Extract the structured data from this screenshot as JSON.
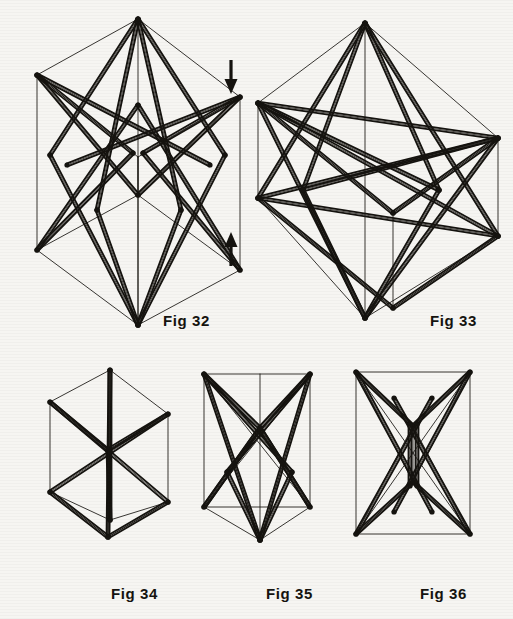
{
  "page": {
    "background_color": "#f6f5f2",
    "ink_color": "#15130f",
    "width": 513,
    "height": 619
  },
  "labels": [
    {
      "id": "fig32",
      "text": "Fig 32",
      "x": 163,
      "y": 312
    },
    {
      "id": "fig33",
      "text": "Fig 33",
      "x": 430,
      "y": 312
    },
    {
      "id": "fig34",
      "text": "Fig 34",
      "x": 111,
      "y": 585
    },
    {
      "id": "fig35",
      "text": "Fig 35",
      "x": 266,
      "y": 585
    },
    {
      "id": "fig36",
      "text": "Fig 36",
      "x": 420,
      "y": 585
    }
  ],
  "arrows": [
    {
      "id": "arrow-down",
      "direction": "down",
      "x": 230,
      "y_top": 60,
      "y_bottom": 92
    },
    {
      "id": "arrow-up",
      "direction": "up",
      "x": 230,
      "y_top": 232,
      "y_bottom": 264
    }
  ],
  "figures": [
    {
      "id": "fig32",
      "name": "tall-octahedral-tensegrity",
      "caption": "Fig 32",
      "viewbox": "0 0 250 335",
      "x": 5,
      "y": 5,
      "w": 250,
      "h": 335,
      "thin_lines": [
        [
          32,
          70,
          133,
          14
        ],
        [
          133,
          14,
          235,
          92
        ],
        [
          235,
          92,
          133,
          152
        ],
        [
          133,
          152,
          32,
          70
        ],
        [
          32,
          70,
          32,
          245
        ],
        [
          133,
          14,
          133,
          320
        ],
        [
          235,
          92,
          235,
          265
        ],
        [
          133,
          152,
          133,
          320
        ],
        [
          32,
          245,
          133,
          320
        ],
        [
          133,
          320,
          235,
          265
        ],
        [
          235,
          265,
          133,
          190
        ],
        [
          133,
          190,
          32,
          245
        ],
        [
          133,
          152,
          133,
          190
        ]
      ],
      "thick_struts": [
        [
          133,
          14,
          45,
          150
        ],
        [
          133,
          14,
          220,
          150
        ],
        [
          133,
          14,
          92,
          205
        ],
        [
          133,
          14,
          176,
          205
        ],
        [
          32,
          70,
          133,
          190
        ],
        [
          235,
          92,
          133,
          190
        ],
        [
          32,
          70,
          205,
          160
        ],
        [
          235,
          92,
          62,
          160
        ],
        [
          45,
          150,
          133,
          320
        ],
        [
          220,
          150,
          133,
          320
        ],
        [
          32,
          245,
          133,
          100
        ],
        [
          235,
          265,
          133,
          100
        ],
        [
          32,
          245,
          128,
          148
        ],
        [
          235,
          265,
          138,
          148
        ],
        [
          92,
          205,
          133,
          320
        ],
        [
          176,
          205,
          133,
          320
        ],
        [
          32,
          70,
          128,
          148
        ],
        [
          235,
          92,
          138,
          148
        ]
      ]
    },
    {
      "id": "fig33",
      "name": "flattened-octahedral-tensegrity",
      "caption": "Fig 33",
      "viewbox": "0 0 270 330",
      "x": 243,
      "y": 8,
      "w": 270,
      "h": 330,
      "thin_lines": [
        [
          15,
          95,
          122,
          15
        ],
        [
          122,
          15,
          255,
          130
        ],
        [
          255,
          130,
          150,
          205
        ],
        [
          150,
          205,
          15,
          95
        ],
        [
          15,
          95,
          15,
          190
        ],
        [
          122,
          15,
          122,
          310
        ],
        [
          255,
          130,
          255,
          228
        ],
        [
          150,
          205,
          150,
          300
        ],
        [
          15,
          190,
          122,
          310
        ],
        [
          122,
          310,
          255,
          228
        ],
        [
          255,
          228,
          150,
          300
        ],
        [
          150,
          300,
          15,
          190
        ]
      ],
      "thick_struts": [
        [
          122,
          15,
          15,
          190
        ],
        [
          122,
          15,
          255,
          228
        ],
        [
          122,
          15,
          60,
          182
        ],
        [
          122,
          15,
          196,
          182
        ],
        [
          15,
          95,
          255,
          130
        ],
        [
          15,
          95,
          255,
          228
        ],
        [
          15,
          190,
          255,
          130
        ],
        [
          15,
          190,
          255,
          228
        ],
        [
          15,
          95,
          122,
          310
        ],
        [
          255,
          130,
          122,
          310
        ],
        [
          60,
          182,
          122,
          310
        ],
        [
          196,
          182,
          122,
          310
        ],
        [
          15,
          95,
          150,
          205
        ],
        [
          150,
          205,
          255,
          130
        ],
        [
          15,
          190,
          150,
          300
        ],
        [
          150,
          300,
          255,
          228
        ],
        [
          15,
          95,
          196,
          182
        ],
        [
          255,
          130,
          60,
          182
        ]
      ]
    },
    {
      "id": "fig34",
      "name": "cube-with-body-diagonals",
      "caption": "Fig 34",
      "viewbox": "0 0 140 180",
      "x": 38,
      "y": 362,
      "w": 140,
      "h": 180,
      "thin_lines": [
        [
          12,
          40,
          72,
          8
        ],
        [
          72,
          8,
          130,
          52
        ],
        [
          130,
          52,
          70,
          88
        ],
        [
          70,
          88,
          12,
          40
        ],
        [
          12,
          40,
          12,
          130
        ],
        [
          72,
          8,
          72,
          158
        ],
        [
          130,
          52,
          130,
          140
        ],
        [
          70,
          88,
          70,
          175
        ],
        [
          12,
          130,
          72,
          158
        ],
        [
          72,
          158,
          130,
          140
        ],
        [
          130,
          140,
          70,
          175
        ],
        [
          70,
          175,
          12,
          130
        ],
        [
          70,
          88,
          70,
          175
        ]
      ],
      "thick_struts": [
        [
          12,
          40,
          130,
          140
        ],
        [
          130,
          52,
          12,
          130
        ],
        [
          72,
          8,
          70,
          175
        ],
        [
          70,
          88,
          72,
          158
        ],
        [
          12,
          40,
          70,
          88
        ],
        [
          70,
          88,
          130,
          52
        ],
        [
          12,
          130,
          70,
          175
        ],
        [
          70,
          175,
          130,
          140
        ],
        [
          72,
          8,
          72,
          90
        ],
        [
          72,
          90,
          72,
          158
        ]
      ]
    },
    {
      "id": "fig35",
      "name": "tensegrity-front-oblique",
      "caption": "Fig 35",
      "viewbox": "0 0 135 185",
      "x": 192,
      "y": 362,
      "w": 135,
      "h": 185,
      "thin_lines": [
        [
          12,
          12,
          118,
          12
        ],
        [
          118,
          12,
          118,
          145
        ],
        [
          118,
          145,
          12,
          145
        ],
        [
          12,
          145,
          12,
          12
        ],
        [
          12,
          12,
          68,
          178
        ],
        [
          118,
          12,
          68,
          178
        ],
        [
          12,
          145,
          68,
          178
        ],
        [
          118,
          145,
          68,
          178
        ],
        [
          68,
          12,
          68,
          178
        ],
        [
          12,
          12,
          118,
          145
        ],
        [
          118,
          12,
          12,
          145
        ]
      ],
      "thick_struts": [
        [
          12,
          12,
          68,
          66
        ],
        [
          118,
          12,
          68,
          66
        ],
        [
          12,
          12,
          100,
          110
        ],
        [
          118,
          12,
          35,
          110
        ],
        [
          68,
          66,
          12,
          145
        ],
        [
          68,
          66,
          118,
          145
        ],
        [
          12,
          12,
          68,
          178
        ],
        [
          118,
          12,
          68,
          178
        ],
        [
          35,
          110,
          68,
          178
        ],
        [
          100,
          110,
          68,
          178
        ],
        [
          12,
          145,
          68,
          66
        ],
        [
          118,
          145,
          68,
          66
        ]
      ]
    },
    {
      "id": "fig36",
      "name": "tensegrity-edge-on-view",
      "caption": "Fig 36",
      "viewbox": "0 0 145 185",
      "x": 342,
      "y": 362,
      "w": 145,
      "h": 185,
      "thin_lines": [
        [
          14,
          10,
          128,
          10
        ],
        [
          128,
          10,
          128,
          172
        ],
        [
          128,
          172,
          14,
          172
        ],
        [
          14,
          172,
          14,
          10
        ],
        [
          14,
          10,
          128,
          172
        ],
        [
          128,
          10,
          14,
          172
        ],
        [
          14,
          10,
          71,
          64
        ],
        [
          128,
          10,
          71,
          64
        ],
        [
          14,
          172,
          71,
          120
        ],
        [
          128,
          172,
          71,
          120
        ],
        [
          71,
          64,
          71,
          120
        ],
        [
          14,
          10,
          71,
          120
        ],
        [
          128,
          10,
          71,
          120
        ],
        [
          14,
          172,
          71,
          64
        ],
        [
          128,
          172,
          71,
          64
        ]
      ],
      "thick_struts": [
        [
          14,
          10,
          71,
          64
        ],
        [
          128,
          10,
          71,
          64
        ],
        [
          14,
          172,
          71,
          120
        ],
        [
          128,
          172,
          71,
          120
        ],
        [
          14,
          10,
          90,
          150
        ],
        [
          128,
          10,
          52,
          150
        ],
        [
          14,
          172,
          90,
          36
        ],
        [
          128,
          172,
          52,
          36
        ],
        [
          68,
          62,
          68,
          124
        ],
        [
          75,
          62,
          75,
          124
        ]
      ]
    }
  ]
}
